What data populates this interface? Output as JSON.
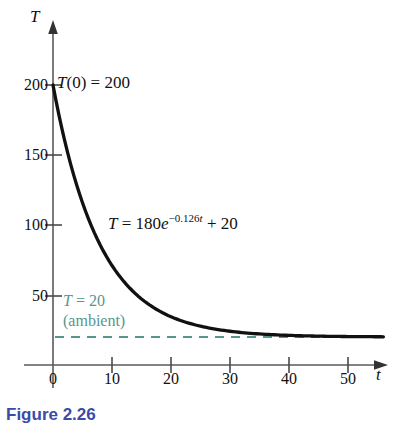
{
  "figure": {
    "caption": "Figure 2.26",
    "background": "#ffffff",
    "curve_color": "#111111",
    "axis_color": "#555555",
    "ambient_color": "#55978f",
    "caption_color": "#3b4ba8"
  },
  "axes": {
    "y_axis_label": "T",
    "x_axis_label": "t",
    "y_ticks": [
      "200",
      "150",
      "100",
      "50"
    ],
    "x_ticks": [
      "0",
      "10",
      "20",
      "30",
      "40",
      "50"
    ]
  },
  "annotations": {
    "initial_value": {
      "fn": "T",
      "rest": "(0) = 200"
    },
    "equation": {
      "lhs": "T",
      "mid": " = 180",
      "base": "e",
      "exp_num": "−0.126",
      "exp_var": "t",
      "tail": " + 20"
    },
    "ambient_line1_var": "T",
    "ambient_line1_rest": " = 20",
    "ambient_line2": "(ambient)"
  },
  "chart_data": {
    "type": "line",
    "title": "",
    "xlabel": "t",
    "ylabel": "T",
    "xlim": [
      0,
      56
    ],
    "ylim": [
      0,
      215
    ],
    "grid": false,
    "legend": "none",
    "equation_text": "T = 180e^(-0.126t) + 20",
    "model": {
      "amplitude": 180,
      "rate": -0.126,
      "offset": 20
    },
    "x_ticks": [
      0,
      10,
      20,
      30,
      40,
      50
    ],
    "y_ticks": [
      50,
      100,
      150,
      200
    ],
    "series": [
      {
        "name": "T = 180e^(-0.126t) + 20",
        "style": "solid",
        "color": "#111111",
        "x": [
          0,
          2,
          4,
          6,
          8,
          10,
          12,
          14,
          16,
          18,
          20,
          22,
          24,
          26,
          28,
          30,
          32,
          34,
          36,
          38,
          40,
          44,
          48,
          52,
          56
        ],
        "y": [
          200,
          160,
          129,
          104.6,
          85.6,
          71.2,
          59.8,
          51,
          44.1,
          38.8,
          34.5,
          31.2,
          28.6,
          26.6,
          25.1,
          23.9,
          22.9,
          22.3,
          21.8,
          21.4,
          21.1,
          20.7,
          20.4,
          20.2,
          20.1
        ]
      },
      {
        "name": "T = 20 (ambient)",
        "style": "dashed",
        "color": "#55978f",
        "x": [
          0,
          56
        ],
        "y": [
          20,
          20
        ]
      }
    ],
    "annotations": [
      {
        "text": "T(0) = 200",
        "x": 0,
        "y": 200
      },
      {
        "text": "T = 180e^(-0.126t) + 20",
        "x": 10,
        "y": 100
      },
      {
        "text": "T = 20 (ambient)",
        "x": 2,
        "y": 45
      }
    ]
  }
}
